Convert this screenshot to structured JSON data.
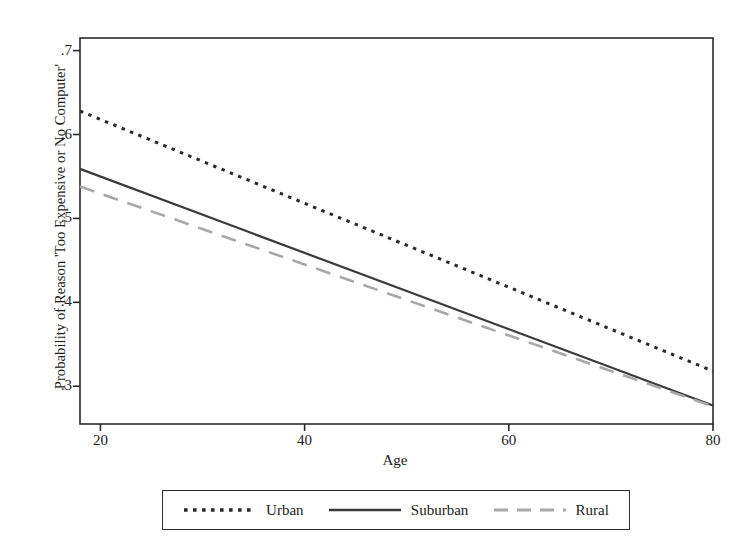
{
  "chart_data": {
    "type": "line",
    "title": "",
    "xlabel": "Age",
    "ylabel": "Probability of Reason 'Too Expensive or No Computer'",
    "xlim": [
      18,
      80
    ],
    "ylim": [
      0.255,
      0.715
    ],
    "xticks": [
      20,
      40,
      60,
      80
    ],
    "xtick_labels": [
      "20",
      "40",
      "60",
      "80"
    ],
    "yticks": [
      0.3,
      0.4,
      0.5,
      0.6,
      0.7
    ],
    "ytick_labels": [
      ".3",
      ".4",
      ".5",
      ".6",
      ".7"
    ],
    "grid": false,
    "legend_position": "below-axes",
    "x": [
      18,
      80
    ],
    "series": [
      {
        "name": "Urban",
        "values": [
          0.628,
          0.318
        ],
        "style": "dotted",
        "color": "#2a2a2a",
        "width": 3.0
      },
      {
        "name": "Suburban",
        "values": [
          0.559,
          0.277
        ],
        "style": "solid",
        "color": "#3a3a3a",
        "width": 2.2
      },
      {
        "name": "Rural",
        "values": [
          0.538,
          0.276
        ],
        "style": "dashed",
        "color": "#a8a8a8",
        "width": 2.6
      }
    ]
  },
  "legend": {
    "entries": [
      {
        "label": "Urban"
      },
      {
        "label": "Suburban"
      },
      {
        "label": "Rural"
      }
    ]
  },
  "axes": {
    "frame_color": "#2a2a2a",
    "background": "#ffffff"
  }
}
